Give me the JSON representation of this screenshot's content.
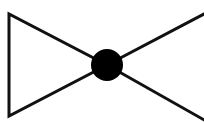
{
  "figure": {
    "name": "bowtie-node-diagram",
    "background_color": "#ffffff",
    "stroke_color": "#111111",
    "node_fill_color": "#000000",
    "stroke_width_px": 3,
    "canvas": {
      "width": 204,
      "height": 122
    }
  },
  "geometry": {
    "center_node": {
      "cx": 107,
      "cy": 65,
      "r": 16
    },
    "left_triangle": {
      "name": "left-triangle",
      "points": "9,14 9,116 107,65",
      "vertices": [
        {
          "label": "top-left",
          "x": 9,
          "y": 14
        },
        {
          "label": "bottom-left",
          "x": 9,
          "y": 116
        },
        {
          "label": "apex-center",
          "x": 107,
          "y": 65
        }
      ]
    },
    "right_upper_line": {
      "name": "right-upper-line",
      "x1": 107,
      "y1": 65,
      "x2": 206,
      "y2": 13
    },
    "right_lower_line": {
      "name": "right-lower-line",
      "x1": 107,
      "y1": 65,
      "x2": 206,
      "y2": 121
    }
  },
  "clipped_text": {
    "note": "Descenders of a text line cropped at the top edge of the image",
    "fragments": [
      {
        "name": "glyph-fragment-left",
        "text": "p"
      },
      {
        "name": "glyph-fragment-right",
        "text": "g"
      }
    ]
  }
}
